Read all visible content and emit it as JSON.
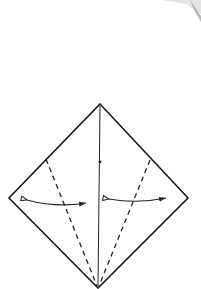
{
  "diagram": {
    "type": "origami-step",
    "colors": {
      "paper": "#ffffff",
      "line": "#1a1a1a",
      "smudge": "#9a9a9a"
    },
    "shapes": {
      "diamond": {
        "top": [
          100,
          104
        ],
        "right": [
          188,
          198
        ],
        "bottom": [
          98,
          288
        ],
        "left": [
          9,
          198
        ]
      },
      "center_crease": {
        "from": [
          100,
          104
        ],
        "to": [
          98,
          288
        ]
      },
      "center_dot": [
        100,
        162
      ],
      "valley_fold_left": {
        "from": [
          46,
          159
        ],
        "to": [
          98,
          288
        ]
      },
      "valley_fold_right": {
        "from": [
          150,
          160
        ],
        "to": [
          98,
          288
        ]
      },
      "arrow_left": {
        "from": [
          26,
          200
        ],
        "to": [
          87,
          203
        ],
        "style": "fold-unfold"
      },
      "arrow_right": {
        "from": [
          108,
          199
        ],
        "to": [
          167,
          198
        ],
        "style": "fold-unfold"
      }
    }
  }
}
